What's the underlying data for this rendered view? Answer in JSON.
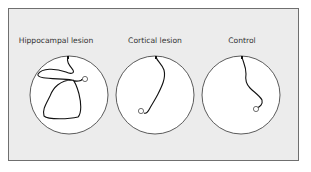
{
  "figure": {
    "panels": [
      {
        "label": "Hippocampal lesion",
        "label_x": 56,
        "cx": 69,
        "cy": 95,
        "r": 39,
        "path": "M68 57 C66 62 70 66 73 70 C75 74 70 74 66 72 C55 68 42 68 38 74 C36 80 60 78 72 80 C76 82 82 81 82 79 M72 80 C60 80 53 88 50 96 C46 104 42 110 44 116 C48 120 70 119 78 117 C82 113 81 102 79 94 C77 87 76 83 73 80",
        "platform": {
          "x": 84,
          "y": 78
        }
      },
      {
        "label": "Cortical lesion",
        "label_x": 155,
        "cx": 155,
        "cy": 95,
        "r": 39,
        "path": "M156 57 C157 61 162 64 164 70 C166 78 162 86 158 94 C155 100 152 104 150 108 C148 112 146 114 144 113",
        "platform": {
          "x": 141,
          "y": 110
        }
      },
      {
        "label": "Control",
        "label_x": 242,
        "cx": 241,
        "cy": 95,
        "r": 39,
        "path": "M242 57 C243 62 246 66 246 74 C245 80 246 84 250 88 C254 92 260 96 262 100 C263 104 260 107 257 108",
        "platform": {
          "x": 256,
          "y": 109
        }
      }
    ]
  }
}
